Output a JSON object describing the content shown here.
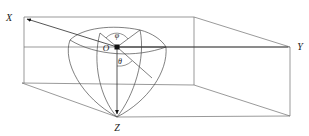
{
  "figure": {
    "background_color": "#ffffff",
    "line_color": "#6e6e6e",
    "label_color": "#1a1a1a"
  },
  "labels": {
    "x_axis": "X",
    "y_axis": "Y",
    "z_axis": "Z",
    "origin": "O",
    "azimuth_angle": "φ",
    "polar_angle": "θ"
  },
  "geometry": {
    "origin_point": {
      "x": 117,
      "y": 47
    },
    "x_axis_tip": {
      "x": 25,
      "y": 19
    },
    "y_axis_tip": {
      "x": 290,
      "y": 47
    },
    "z_axis_tip": {
      "x": 117,
      "y": 117
    },
    "sphere_radius_px": 48,
    "box_front_top_left": {
      "x": 24,
      "y": 17
    },
    "box_front_bottom_left": {
      "x": 22,
      "y": 83
    },
    "box_back_top_right": {
      "x": 290,
      "y": 47
    },
    "box_back_bottom_right": {
      "x": 290,
      "y": 116
    }
  }
}
